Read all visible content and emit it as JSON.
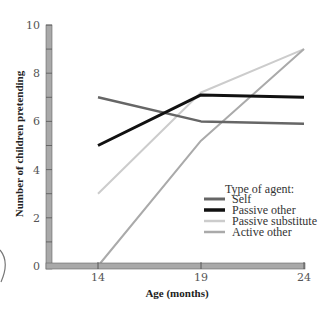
{
  "chart_data": {
    "type": "line",
    "title": "",
    "xlabel": "Age (months)",
    "ylabel": "Number of children pretending",
    "x": [
      14,
      19,
      24
    ],
    "xticks": [
      "14",
      "19",
      "24"
    ],
    "yticks": [
      "0",
      "2",
      "4",
      "6",
      "8",
      "10"
    ],
    "ylim": [
      0,
      10
    ],
    "grid": false,
    "legend_position": "lower right",
    "legend_title": "Type of agent:",
    "series": [
      {
        "name": "Self",
        "values": [
          7,
          6,
          5.9
        ],
        "color": "#666666",
        "width": 2.5
      },
      {
        "name": "Passive other",
        "values": [
          5,
          7.1,
          7
        ],
        "color": "#111111",
        "width": 3
      },
      {
        "name": "Passive substitute",
        "values": [
          3,
          7.2,
          9
        ],
        "color": "#cccccc",
        "width": 2
      },
      {
        "name": "Active other",
        "values": [
          0,
          5.2,
          9
        ],
        "color": "#aaaaaa",
        "width": 2
      }
    ]
  },
  "axis": {
    "color": "#a9a9a9"
  }
}
